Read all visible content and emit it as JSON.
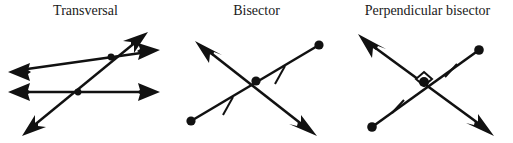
{
  "figure": {
    "background_color": "#ffffff",
    "ink_color": "#111111",
    "width": 513,
    "height": 143
  },
  "panels": [
    {
      "id": "transversal",
      "label": "Transversal",
      "description": "Two parallel lines cut by a third line",
      "elements": {
        "line_upper": "double-headed arrow line, slightly rising to the right",
        "line_lower": "double-headed arrow line, horizontal",
        "line_transversal": "double-headed arrow line crossing both",
        "intersection_dots": 2,
        "tick_marks": 0,
        "right_angle_marker": false
      }
    },
    {
      "id": "bisector",
      "label": "Bisector",
      "description": "A line cutting a segment into two congruent halves at its midpoint",
      "elements": {
        "segment": "segment with filled endpoint dots, upper-right to lower-left",
        "bisecting_line": "double-headed arrow line through the midpoint",
        "intersection_dots": 1,
        "tick_marks": 2,
        "right_angle_marker": false
      }
    },
    {
      "id": "perpendicular-bisector",
      "label": "Perpendicular bisector",
      "description": "A line cutting a segment into two congruent halves at a right angle",
      "elements": {
        "segment": "segment with filled endpoint dots, upper-right to lower-left",
        "bisecting_line": "double-headed arrow line through the midpoint",
        "intersection_dots": 1,
        "tick_marks": 2,
        "right_angle_marker": true
      }
    }
  ]
}
